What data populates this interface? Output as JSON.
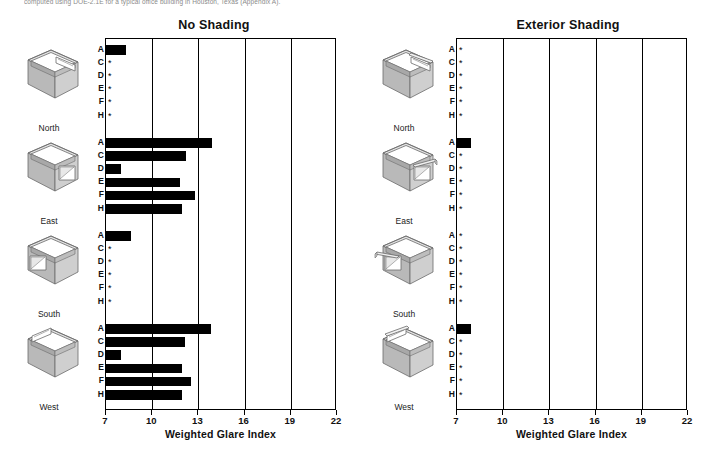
{
  "caption": {
    "top_text": "computed using DOE-2.1E for a typical office building in Houston, Texas (Appendix A)."
  },
  "axis": {
    "title": "Weighted Glare Index",
    "ticks": [
      7,
      10,
      13,
      16,
      19,
      22
    ],
    "min": 7,
    "max": 22
  },
  "row_labels": [
    "A",
    "C",
    "D",
    "E",
    "F",
    "H"
  ],
  "orientation_labels": [
    "North",
    "East",
    "South",
    "West"
  ],
  "icons": {
    "north": "building-box-opening-back-right",
    "east": "building-box-window-right",
    "south": "building-box-window-left",
    "west": "building-box-opening-back-left",
    "north_shaded": "building-box-overhang-back-right",
    "east_shaded": "building-box-overhang-right",
    "south_shaded": "building-box-overhang-left",
    "west_shaded": "building-box-overhang-back-left"
  },
  "colors": {
    "bar": "#000000",
    "axis": "#000000",
    "background": "#ffffff",
    "building_light": "#dcdcdc",
    "building_mid": "#c6c6c6",
    "building_dark": "#b0b0b0"
  },
  "chart_data": [
    {
      "type": "bar",
      "title": "No Shading",
      "xlabel": "Weighted Glare Index",
      "ylabel": "",
      "xlim": [
        7,
        22
      ],
      "grid": true,
      "orientation": "horizontal",
      "legend": "none",
      "categories": [
        "A",
        "C",
        "D",
        "E",
        "F",
        "H"
      ],
      "groups": [
        {
          "name": "North",
          "values": [
            8.3,
            null,
            null,
            null,
            null,
            null
          ],
          "markers": [
            null,
            "*",
            "*",
            "*",
            "*",
            "*"
          ]
        },
        {
          "name": "East",
          "values": [
            13.9,
            12.2,
            8.0,
            11.8,
            12.8,
            11.9
          ],
          "markers": [
            null,
            null,
            null,
            null,
            null,
            null
          ]
        },
        {
          "name": "South",
          "values": [
            8.6,
            null,
            null,
            null,
            null,
            null
          ],
          "markers": [
            null,
            "*",
            "*",
            "*",
            "*",
            "*"
          ]
        },
        {
          "name": "West",
          "values": [
            13.8,
            12.1,
            8.0,
            11.9,
            12.5,
            11.9
          ],
          "markers": [
            null,
            null,
            null,
            null,
            null,
            null
          ]
        }
      ]
    },
    {
      "type": "bar",
      "title": "Exterior Shading",
      "xlabel": "Weighted Glare Index",
      "ylabel": "",
      "xlim": [
        7,
        22
      ],
      "grid": true,
      "orientation": "horizontal",
      "legend": "none",
      "categories": [
        "A",
        "C",
        "D",
        "E",
        "F",
        "H"
      ],
      "groups": [
        {
          "name": "North",
          "values": [
            null,
            null,
            null,
            null,
            null,
            null
          ],
          "markers": [
            "*",
            "*",
            "*",
            "*",
            "*",
            "*"
          ]
        },
        {
          "name": "East",
          "values": [
            7.9,
            null,
            null,
            null,
            null,
            null
          ],
          "markers": [
            null,
            "*",
            "*",
            "*",
            "*",
            "*"
          ]
        },
        {
          "name": "South",
          "values": [
            null,
            null,
            null,
            null,
            null,
            null
          ],
          "markers": [
            "*",
            "*",
            "*",
            "*",
            "*",
            "*"
          ]
        },
        {
          "name": "West",
          "values": [
            7.9,
            null,
            null,
            null,
            null,
            null
          ],
          "markers": [
            null,
            "*",
            "*",
            "*",
            "*",
            "*"
          ]
        }
      ]
    }
  ]
}
